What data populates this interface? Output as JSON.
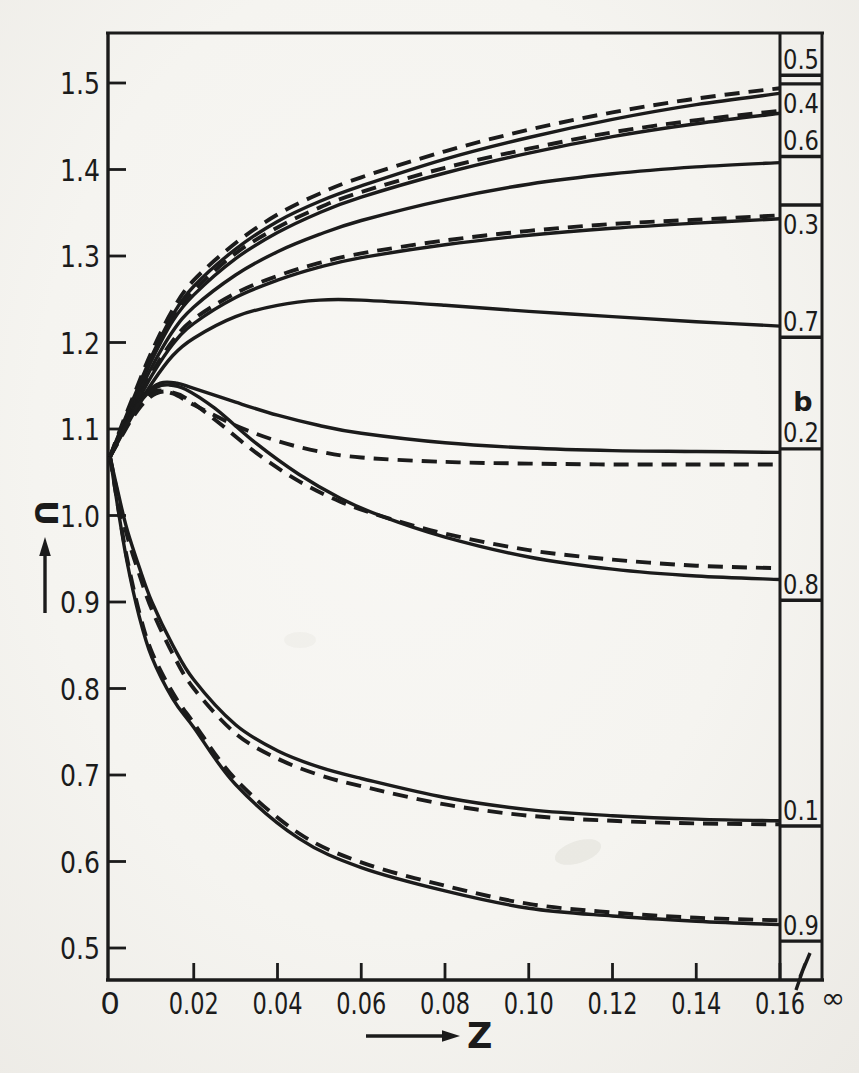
{
  "figure": {
    "paper_color": "#f6f5f1",
    "ink_color": "#1b1b1b",
    "x_axis": {
      "label": "Z",
      "infinity_label": "∞"
    },
    "y_axis": {
      "label": "U"
    }
  },
  "chart_data": {
    "type": "line",
    "title": "",
    "xlabel": "Z",
    "ylabel": "U",
    "x_range": [
      0,
      0.16
    ],
    "y_ticks_shown": [
      1.5,
      1.4,
      1.3,
      1.2,
      1.1,
      1.0,
      0.9,
      0.8,
      0.7,
      0.6,
      0.5
    ],
    "x_ticks": [
      {
        "z": 0,
        "label": "0"
      },
      {
        "z": 0.02,
        "label": "0.02"
      },
      {
        "z": 0.04,
        "label": "0.04"
      },
      {
        "z": 0.06,
        "label": "0.06"
      },
      {
        "z": 0.08,
        "label": "0.08"
      },
      {
        "z": 0.1,
        "label": "0.10"
      },
      {
        "z": 0.12,
        "label": "0.12"
      },
      {
        "z": 0.14,
        "label": "0.14"
      },
      {
        "z": 0.16,
        "label": "0.16"
      }
    ],
    "y_tick_labels": [
      "1.5",
      "1.4",
      "1.3",
      "1.2",
      "1.1",
      "1.0",
      "0.9",
      "0.8",
      "0.7",
      "0.6",
      "0.5"
    ],
    "x_axis_break_after": 0.16,
    "infinity_column_header": "b",
    "legend_note": "right column: value of each curve at Z = infinity, labelled by parameter b",
    "asymptotes": [
      {
        "b": "0.5",
        "u_infinity": 1.509,
        "label_side": "above"
      },
      {
        "b": "0.4",
        "u_infinity": 1.499,
        "label_side": "below"
      },
      {
        "b": "0.6",
        "u_infinity": 1.415,
        "label_side": "above"
      },
      {
        "b": "0.3",
        "u_infinity": 1.359,
        "label_side": "below"
      },
      {
        "b": "0.7",
        "u_infinity": 1.206,
        "label_side": "above"
      },
      {
        "b": "0.2",
        "u_infinity": 1.077,
        "label_side": "above",
        "header_above": true
      },
      {
        "b": "0.8",
        "u_infinity": 0.902,
        "label_side": "above"
      },
      {
        "b": "0.1",
        "u_infinity": 0.641,
        "label_side": "above"
      },
      {
        "b": "0.9",
        "u_infinity": 0.508,
        "label_side": "above"
      }
    ],
    "series": [
      {
        "name": "b=0.5 dashed",
        "b": "0.5",
        "style": "dashed",
        "points": [
          [
            0,
            1.068
          ],
          [
            0.003,
            1.107
          ],
          [
            0.006,
            1.143
          ],
          [
            0.01,
            1.19
          ],
          [
            0.015,
            1.238
          ],
          [
            0.02,
            1.272
          ],
          [
            0.03,
            1.315
          ],
          [
            0.04,
            1.348
          ],
          [
            0.05,
            1.372
          ],
          [
            0.06,
            1.391
          ],
          [
            0.08,
            1.421
          ],
          [
            0.1,
            1.446
          ],
          [
            0.12,
            1.466
          ],
          [
            0.14,
            1.482
          ],
          [
            0.16,
            1.494
          ]
        ]
      },
      {
        "name": "b=0.5 solid",
        "b": "0.5",
        "style": "solid",
        "points": [
          [
            0,
            1.068
          ],
          [
            0.003,
            1.105
          ],
          [
            0.006,
            1.14
          ],
          [
            0.01,
            1.185
          ],
          [
            0.015,
            1.232
          ],
          [
            0.02,
            1.265
          ],
          [
            0.03,
            1.308
          ],
          [
            0.04,
            1.34
          ],
          [
            0.05,
            1.363
          ],
          [
            0.06,
            1.381
          ],
          [
            0.08,
            1.412
          ],
          [
            0.1,
            1.437
          ],
          [
            0.12,
            1.458
          ],
          [
            0.14,
            1.475
          ],
          [
            0.16,
            1.488
          ]
        ]
      },
      {
        "name": "b=0.4 dashed",
        "b": "0.4",
        "style": "dashed",
        "points": [
          [
            0,
            1.068
          ],
          [
            0.003,
            1.104
          ],
          [
            0.006,
            1.139
          ],
          [
            0.01,
            1.183
          ],
          [
            0.015,
            1.229
          ],
          [
            0.02,
            1.26
          ],
          [
            0.03,
            1.303
          ],
          [
            0.04,
            1.333
          ],
          [
            0.05,
            1.356
          ],
          [
            0.06,
            1.374
          ],
          [
            0.08,
            1.402
          ],
          [
            0.1,
            1.424
          ],
          [
            0.12,
            1.443
          ],
          [
            0.14,
            1.457
          ],
          [
            0.16,
            1.468
          ]
        ]
      },
      {
        "name": "b=0.4 solid",
        "b": "0.4",
        "style": "solid",
        "points": [
          [
            0,
            1.068
          ],
          [
            0.003,
            1.103
          ],
          [
            0.006,
            1.137
          ],
          [
            0.01,
            1.18
          ],
          [
            0.015,
            1.225
          ],
          [
            0.02,
            1.255
          ],
          [
            0.03,
            1.297
          ],
          [
            0.04,
            1.327
          ],
          [
            0.05,
            1.35
          ],
          [
            0.06,
            1.368
          ],
          [
            0.08,
            1.396
          ],
          [
            0.1,
            1.419
          ],
          [
            0.12,
            1.438
          ],
          [
            0.14,
            1.453
          ],
          [
            0.16,
            1.465
          ]
        ]
      },
      {
        "name": "b=0.6 solid",
        "b": "0.6",
        "style": "solid",
        "points": [
          [
            0,
            1.068
          ],
          [
            0.003,
            1.1
          ],
          [
            0.006,
            1.132
          ],
          [
            0.01,
            1.172
          ],
          [
            0.015,
            1.213
          ],
          [
            0.02,
            1.241
          ],
          [
            0.03,
            1.278
          ],
          [
            0.04,
            1.305
          ],
          [
            0.05,
            1.325
          ],
          [
            0.06,
            1.341
          ],
          [
            0.08,
            1.365
          ],
          [
            0.1,
            1.383
          ],
          [
            0.12,
            1.395
          ],
          [
            0.14,
            1.403
          ],
          [
            0.16,
            1.408
          ]
        ]
      },
      {
        "name": "b=0.3 dashed",
        "b": "0.3",
        "style": "dashed",
        "points": [
          [
            0,
            1.068
          ],
          [
            0.003,
            1.098
          ],
          [
            0.006,
            1.128
          ],
          [
            0.01,
            1.165
          ],
          [
            0.015,
            1.202
          ],
          [
            0.02,
            1.227
          ],
          [
            0.03,
            1.257
          ],
          [
            0.04,
            1.277
          ],
          [
            0.05,
            1.292
          ],
          [
            0.06,
            1.303
          ],
          [
            0.08,
            1.318
          ],
          [
            0.1,
            1.329
          ],
          [
            0.12,
            1.337
          ],
          [
            0.14,
            1.342
          ],
          [
            0.16,
            1.347
          ]
        ]
      },
      {
        "name": "b=0.3 solid",
        "b": "0.3",
        "style": "solid",
        "points": [
          [
            0,
            1.068
          ],
          [
            0.003,
            1.097
          ],
          [
            0.006,
            1.126
          ],
          [
            0.01,
            1.162
          ],
          [
            0.015,
            1.198
          ],
          [
            0.02,
            1.222
          ],
          [
            0.03,
            1.252
          ],
          [
            0.04,
            1.272
          ],
          [
            0.05,
            1.287
          ],
          [
            0.06,
            1.298
          ],
          [
            0.08,
            1.313
          ],
          [
            0.1,
            1.324
          ],
          [
            0.12,
            1.332
          ],
          [
            0.14,
            1.338
          ],
          [
            0.16,
            1.343
          ]
        ]
      },
      {
        "name": "b=0.7 solid",
        "b": "0.7",
        "style": "solid",
        "points": [
          [
            0,
            1.068
          ],
          [
            0.003,
            1.095
          ],
          [
            0.006,
            1.121
          ],
          [
            0.01,
            1.153
          ],
          [
            0.015,
            1.185
          ],
          [
            0.02,
            1.205
          ],
          [
            0.03,
            1.23
          ],
          [
            0.04,
            1.243
          ],
          [
            0.05,
            1.249
          ],
          [
            0.06,
            1.249
          ],
          [
            0.08,
            1.243
          ],
          [
            0.1,
            1.236
          ],
          [
            0.12,
            1.23
          ],
          [
            0.14,
            1.224
          ],
          [
            0.16,
            1.219
          ]
        ]
      },
      {
        "name": "b=0.2 solid",
        "b": "0.2",
        "style": "solid",
        "points": [
          [
            0,
            1.068
          ],
          [
            0.002,
            1.088
          ],
          [
            0.005,
            1.116
          ],
          [
            0.008,
            1.139
          ],
          [
            0.012,
            1.153
          ],
          [
            0.016,
            1.153
          ],
          [
            0.02,
            1.147
          ],
          [
            0.03,
            1.131
          ],
          [
            0.04,
            1.116
          ],
          [
            0.05,
            1.104
          ],
          [
            0.06,
            1.095
          ],
          [
            0.08,
            1.084
          ],
          [
            0.1,
            1.078
          ],
          [
            0.12,
            1.075
          ],
          [
            0.14,
            1.074
          ],
          [
            0.16,
            1.073
          ]
        ]
      },
      {
        "name": "b=0.2 dashed",
        "b": "0.2",
        "style": "dashed",
        "points": [
          [
            0,
            1.068
          ],
          [
            0.002,
            1.086
          ],
          [
            0.005,
            1.112
          ],
          [
            0.008,
            1.133
          ],
          [
            0.011,
            1.144
          ],
          [
            0.015,
            1.141
          ],
          [
            0.02,
            1.128
          ],
          [
            0.03,
            1.104
          ],
          [
            0.04,
            1.086
          ],
          [
            0.05,
            1.074
          ],
          [
            0.06,
            1.067
          ],
          [
            0.08,
            1.062
          ],
          [
            0.1,
            1.06
          ],
          [
            0.12,
            1.059
          ],
          [
            0.14,
            1.059
          ],
          [
            0.16,
            1.059
          ]
        ]
      },
      {
        "name": "b=0.8 dashed",
        "b": "0.8",
        "style": "dashed",
        "points": [
          [
            0,
            1.068
          ],
          [
            0.002,
            1.085
          ],
          [
            0.005,
            1.11
          ],
          [
            0.008,
            1.13
          ],
          [
            0.011,
            1.141
          ],
          [
            0.014,
            1.143
          ],
          [
            0.018,
            1.136
          ],
          [
            0.025,
            1.111
          ],
          [
            0.035,
            1.072
          ],
          [
            0.045,
            1.04
          ],
          [
            0.055,
            1.016
          ],
          [
            0.065,
            0.999
          ],
          [
            0.08,
            0.979
          ],
          [
            0.1,
            0.96
          ],
          [
            0.12,
            0.949
          ],
          [
            0.14,
            0.942
          ],
          [
            0.16,
            0.939
          ]
        ]
      },
      {
        "name": "b=0.8 solid",
        "b": "0.8",
        "style": "solid",
        "points": [
          [
            0,
            1.068
          ],
          [
            0.002,
            1.087
          ],
          [
            0.005,
            1.114
          ],
          [
            0.008,
            1.136
          ],
          [
            0.011,
            1.148
          ],
          [
            0.014,
            1.151
          ],
          [
            0.018,
            1.146
          ],
          [
            0.025,
            1.124
          ],
          [
            0.035,
            1.083
          ],
          [
            0.045,
            1.048
          ],
          [
            0.055,
            1.02
          ],
          [
            0.065,
            0.999
          ],
          [
            0.08,
            0.975
          ],
          [
            0.1,
            0.952
          ],
          [
            0.12,
            0.938
          ],
          [
            0.14,
            0.93
          ],
          [
            0.16,
            0.926
          ]
        ]
      },
      {
        "name": "b=0.1 solid",
        "b": "0.1",
        "style": "solid",
        "points": [
          [
            0,
            1.068
          ],
          [
            0.002,
            1.025
          ],
          [
            0.004,
            0.985
          ],
          [
            0.007,
            0.94
          ],
          [
            0.01,
            0.9
          ],
          [
            0.015,
            0.85
          ],
          [
            0.02,
            0.81
          ],
          [
            0.03,
            0.758
          ],
          [
            0.04,
            0.728
          ],
          [
            0.05,
            0.709
          ],
          [
            0.06,
            0.696
          ],
          [
            0.08,
            0.674
          ],
          [
            0.1,
            0.66
          ],
          [
            0.12,
            0.653
          ],
          [
            0.14,
            0.649
          ],
          [
            0.16,
            0.647
          ]
        ]
      },
      {
        "name": "b=0.1 dashed",
        "b": "0.1",
        "style": "dashed",
        "points": [
          [
            0,
            1.068
          ],
          [
            0.002,
            1.02
          ],
          [
            0.004,
            0.978
          ],
          [
            0.007,
            0.932
          ],
          [
            0.01,
            0.891
          ],
          [
            0.015,
            0.84
          ],
          [
            0.02,
            0.8
          ],
          [
            0.03,
            0.748
          ],
          [
            0.04,
            0.719
          ],
          [
            0.05,
            0.7
          ],
          [
            0.06,
            0.687
          ],
          [
            0.08,
            0.666
          ],
          [
            0.1,
            0.653
          ],
          [
            0.12,
            0.647
          ],
          [
            0.14,
            0.644
          ],
          [
            0.16,
            0.643
          ]
        ]
      },
      {
        "name": "b=0.9 dashed",
        "b": "0.9",
        "style": "dashed",
        "points": [
          [
            0,
            1.068
          ],
          [
            0.002,
            1.008
          ],
          [
            0.004,
            0.952
          ],
          [
            0.007,
            0.888
          ],
          [
            0.01,
            0.842
          ],
          [
            0.015,
            0.795
          ],
          [
            0.02,
            0.76
          ],
          [
            0.03,
            0.695
          ],
          [
            0.045,
            0.633
          ],
          [
            0.06,
            0.599
          ],
          [
            0.08,
            0.572
          ],
          [
            0.1,
            0.551
          ],
          [
            0.12,
            0.541
          ],
          [
            0.14,
            0.535
          ],
          [
            0.16,
            0.532
          ]
        ]
      },
      {
        "name": "b=0.9 solid",
        "b": "0.9",
        "style": "solid",
        "points": [
          [
            0,
            1.068
          ],
          [
            0.002,
            1.005
          ],
          [
            0.004,
            0.948
          ],
          [
            0.007,
            0.883
          ],
          [
            0.01,
            0.836
          ],
          [
            0.015,
            0.788
          ],
          [
            0.02,
            0.755
          ],
          [
            0.03,
            0.689
          ],
          [
            0.045,
            0.627
          ],
          [
            0.06,
            0.593
          ],
          [
            0.08,
            0.566
          ],
          [
            0.1,
            0.546
          ],
          [
            0.12,
            0.537
          ],
          [
            0.14,
            0.531
          ],
          [
            0.16,
            0.527
          ]
        ]
      }
    ]
  }
}
